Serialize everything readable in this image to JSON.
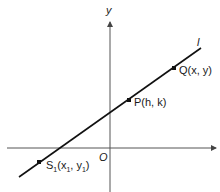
{
  "diagram": {
    "type": "coordinate-geometry",
    "axes": {
      "x_label": "",
      "y_label": "y",
      "origin_label": "O"
    },
    "line": {
      "label": "l"
    },
    "points": [
      {
        "id": "Q",
        "label": "Q(x, y)"
      },
      {
        "id": "P",
        "label": "P(h, k)"
      },
      {
        "id": "S1",
        "label_main": "S",
        "label_sub": "1",
        "label_rest_open": "(x",
        "label_sub2": "1",
        "label_mid": ", y",
        "label_sub3": "1",
        "label_close": ")"
      }
    ],
    "colors": {
      "axis": "#555555",
      "line": "#111111",
      "text": "#1a1a1a"
    }
  }
}
